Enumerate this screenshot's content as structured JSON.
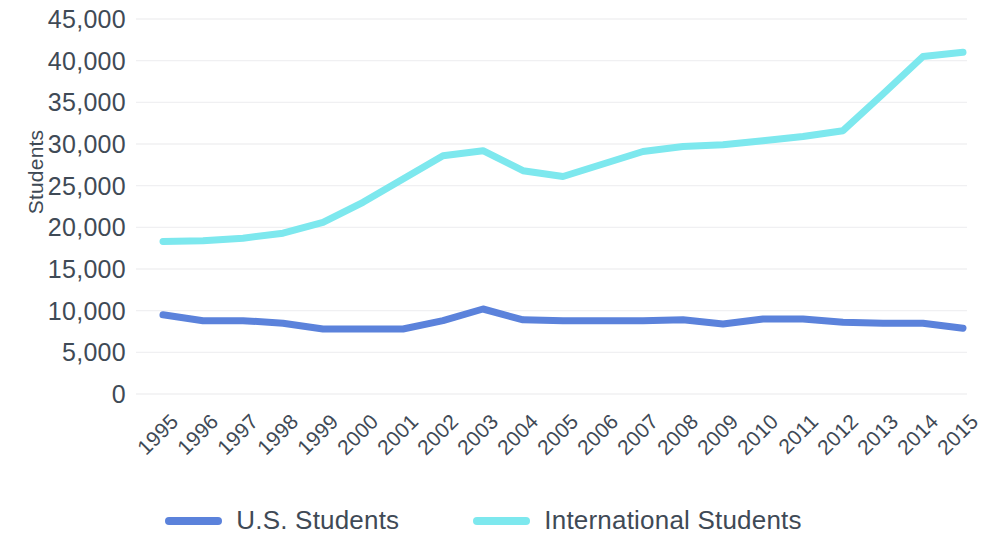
{
  "chart_data": {
    "type": "line",
    "title": "",
    "xlabel": "",
    "ylabel": "Students",
    "ylim": [
      0,
      45000
    ],
    "ytick_step": 5000,
    "grid": true,
    "legend_position": "bottom",
    "categories": [
      "1995",
      "1996",
      "1997",
      "1998",
      "1999",
      "2000",
      "2001",
      "2002",
      "2003",
      "2004",
      "2005",
      "2006",
      "2007",
      "2008",
      "2009",
      "2010",
      "2011",
      "2012",
      "2013",
      "2014",
      "2015"
    ],
    "ytick_labels": [
      "45,000",
      "40,000",
      "35,000",
      "30,000",
      "25,000",
      "20,000",
      "15,000",
      "10,000",
      "5,000",
      "0"
    ],
    "ytick_values": [
      45000,
      40000,
      35000,
      30000,
      25000,
      20000,
      15000,
      10000,
      5000,
      0
    ],
    "series": [
      {
        "name": "U.S. Students",
        "color": "#5B82DB",
        "values": [
          9500,
          8800,
          8800,
          8500,
          7800,
          7800,
          7800,
          8800,
          10200,
          8900,
          8800,
          8800,
          8800,
          8900,
          8400,
          9000,
          9000,
          8600,
          8500,
          8500,
          7900
        ]
      },
      {
        "name": "International Students",
        "color": "#7DE8EE",
        "values": [
          18300,
          18400,
          18700,
          19300,
          20600,
          23000,
          25800,
          28600,
          29200,
          26800,
          26100,
          27600,
          29100,
          29700,
          29900,
          30400,
          30900,
          31600,
          36000,
          40500,
          41000
        ]
      }
    ]
  },
  "axis": {
    "y_title": "Students"
  },
  "legend": {
    "items": [
      {
        "label": "U.S. Students",
        "color": "#5B82DB"
      },
      {
        "label": "International Students",
        "color": "#7DE8EE"
      }
    ]
  },
  "colors": {
    "us_students": "#5B82DB",
    "international_students": "#7DE8EE",
    "grid": "#f0f0f2",
    "text": "#3f4a56",
    "background": "#ffffff"
  }
}
